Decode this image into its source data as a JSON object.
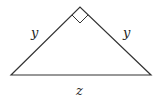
{
  "diagram": {
    "type": "right isosceles triangle",
    "colors": {
      "stroke": "#333333",
      "background": "#ffffff"
    },
    "labels": {
      "left_leg": "y",
      "right_leg": "y",
      "hypotenuse": "z"
    },
    "right_angle_marker": "apex"
  }
}
